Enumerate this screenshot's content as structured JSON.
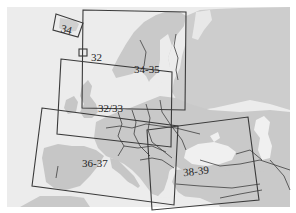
{
  "map": {
    "title": "Europe map sheet index",
    "colors": {
      "sea": "#ececec",
      "land": "#c9c9c9",
      "land_light": "#d6d6d6",
      "frame": "#3a3a3a",
      "border": "#3f3f3f",
      "inland_water": "#f3f3f3"
    },
    "sheets": [
      {
        "id": "34",
        "label": "34"
      },
      {
        "id": "32",
        "label": "32"
      },
      {
        "id": "34-35",
        "label": "34-35"
      },
      {
        "id": "32-33",
        "label": "32/33"
      },
      {
        "id": "36-37",
        "label": "36-37"
      },
      {
        "id": "38-39",
        "label": "38-39"
      }
    ]
  }
}
